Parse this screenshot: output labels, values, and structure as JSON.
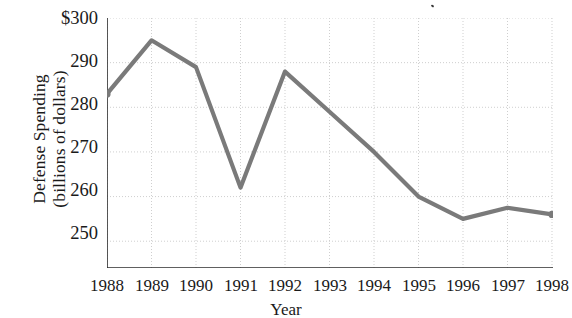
{
  "chart_data": {
    "type": "line",
    "title": "",
    "xlabel": "Year",
    "ylabel": "Defense Spending (billions of dollars)",
    "ylabel_line1": "Defense Spending",
    "ylabel_line2": "(billions of dollars)",
    "categories": [
      1988,
      1989,
      1990,
      1991,
      1992,
      1993,
      1994,
      1995,
      1996,
      1997,
      1998
    ],
    "x_tick_labels": [
      "1988",
      "1989",
      "1990",
      "1991",
      "1992",
      "1993",
      "1994",
      "1995",
      "1996",
      "1997",
      "1998"
    ],
    "values": [
      283,
      295,
      289,
      262,
      288,
      279,
      270,
      260,
      255,
      257.5,
      256
    ],
    "y_tick_labels": [
      "250",
      "260",
      "270",
      "280",
      "290",
      "$300"
    ],
    "y_tick_values": [
      250,
      260,
      270,
      280,
      290,
      300
    ],
    "ylim": [
      244,
      300
    ],
    "xlim": [
      1988,
      1998
    ],
    "grid": true,
    "grid_style": "dotted",
    "legend": "none",
    "line_color": "#7a7a7a",
    "marker_color": "#7a7a7a",
    "axis_color": "#2b2b2b",
    "grid_color": "#cfcfcf",
    "markers": [
      "1988",
      "1998"
    ],
    "currency_prefix": "$"
  }
}
